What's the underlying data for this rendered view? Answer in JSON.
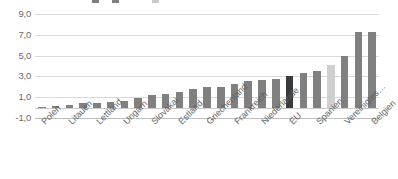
{
  "legend": {
    "items": [
      {
        "label": "",
        "color": "#7f7f7f"
      },
      {
        "label": "",
        "color": "#7f7f7f"
      },
      {
        "label": "",
        "color": "#c9c9c9"
      }
    ]
  },
  "chart_data": {
    "type": "bar",
    "title": "",
    "xlabel": "",
    "ylabel": "",
    "ylim": [
      -1.0,
      9.0
    ],
    "yticks": [
      "9,0",
      "7,0",
      "5,0",
      "3,0",
      "1,0",
      "-1,0"
    ],
    "ytick_values": [
      9.0,
      7.0,
      5.0,
      3.0,
      1.0,
      -1.0
    ],
    "grid": true,
    "legend_position": "top",
    "decimal_separator": ",",
    "categories": [
      "Polen",
      "",
      "Litauen",
      "",
      "Lettland",
      "",
      "Ungarn",
      "",
      "Slovakai",
      "",
      "Estland",
      "",
      "Griechenland",
      "",
      "Frankreich",
      "",
      "Niederlande",
      "",
      "EU",
      "",
      "Spanien",
      "",
      "Vereinigtes…",
      "",
      "Belgien"
    ],
    "visible_tick_labels": [
      "Polen",
      "Litauen",
      "Lettland",
      "Ungarn",
      "Slovakai",
      "Estland",
      "Griechenland",
      "Frankreich",
      "Niederlande",
      "EU",
      "Spanien",
      "Vereinigtes…",
      "Belgien"
    ],
    "values": [
      0.1,
      0.2,
      0.3,
      0.4,
      0.4,
      0.5,
      0.6,
      0.9,
      1.2,
      1.3,
      1.5,
      1.8,
      2.0,
      2.0,
      2.3,
      2.6,
      2.7,
      2.8,
      3.0,
      3.3,
      3.5,
      4.1,
      5.0,
      7.3,
      7.3
    ],
    "bar_styles": [
      "normal",
      "normal",
      "normal",
      "normal",
      "normal",
      "normal",
      "normal",
      "normal",
      "normal",
      "normal",
      "normal",
      "normal",
      "normal",
      "normal",
      "normal",
      "normal",
      "normal",
      "normal",
      "dark",
      "normal",
      "normal",
      "light",
      "normal",
      "normal",
      "normal"
    ],
    "colors": {
      "bar": "#808080",
      "highlight": "#3a3a3a",
      "light": "#cfcfcf",
      "grid": "#d9d9d9",
      "axis": "#bfbfbf",
      "text": "#6b6b6b"
    }
  }
}
